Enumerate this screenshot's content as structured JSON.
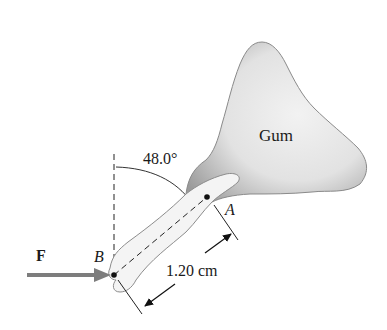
{
  "diagram": {
    "labels": {
      "gum": "Gum",
      "angle": "48.0°",
      "point_a": "A",
      "point_b": "B",
      "force": "F",
      "length": "1.20 cm"
    },
    "colors": {
      "gum_fill_light": "#eeeeee",
      "gum_fill_dark": "#9a9a9a",
      "gum_outline": "#8a8a8a",
      "tooth_fill": "#f4f4f4",
      "tooth_outline": "#8c8c8c",
      "force_arrow": "#7d7d7d",
      "line": "#222222"
    },
    "geometry": {
      "point_a": [
        207,
        197
      ],
      "point_b": [
        114,
        275
      ],
      "angle_from_vertical_deg": 48.0
    }
  }
}
